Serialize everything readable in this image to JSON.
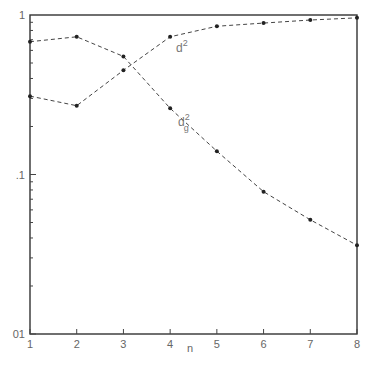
{
  "chart_data": {
    "type": "line",
    "title": "",
    "xlabel": "n",
    "ylabel": "",
    "yscale": "log",
    "ylim": [
      0.01,
      1
    ],
    "xlim": [
      1,
      8
    ],
    "x": [
      1,
      2,
      3,
      4,
      5,
      6,
      7,
      8
    ],
    "x_tick_labels": [
      "1",
      "2",
      "3",
      "4",
      "5",
      "6",
      "7",
      "8"
    ],
    "y_tick_labels": [
      {
        "value": 1,
        "label": "1"
      },
      {
        "value": 0.1,
        "label": ".1"
      },
      {
        "value": 0.01,
        "label": "01"
      }
    ],
    "grid": false,
    "legend": "inline curve labels",
    "series": [
      {
        "name": "d^2",
        "label_base": "d",
        "label_sup": "2",
        "label_sub": "",
        "values": [
          0.31,
          0.27,
          0.45,
          0.73,
          0.85,
          0.89,
          0.93,
          0.96
        ],
        "style": "dashed with dot markers"
      },
      {
        "name": "d_g^2",
        "label_base": "d",
        "label_sup": "2",
        "label_sub": "g",
        "values": [
          0.68,
          0.73,
          0.55,
          0.26,
          0.14,
          0.078,
          0.052,
          0.036
        ],
        "style": "dashed with dot markers"
      }
    ]
  }
}
